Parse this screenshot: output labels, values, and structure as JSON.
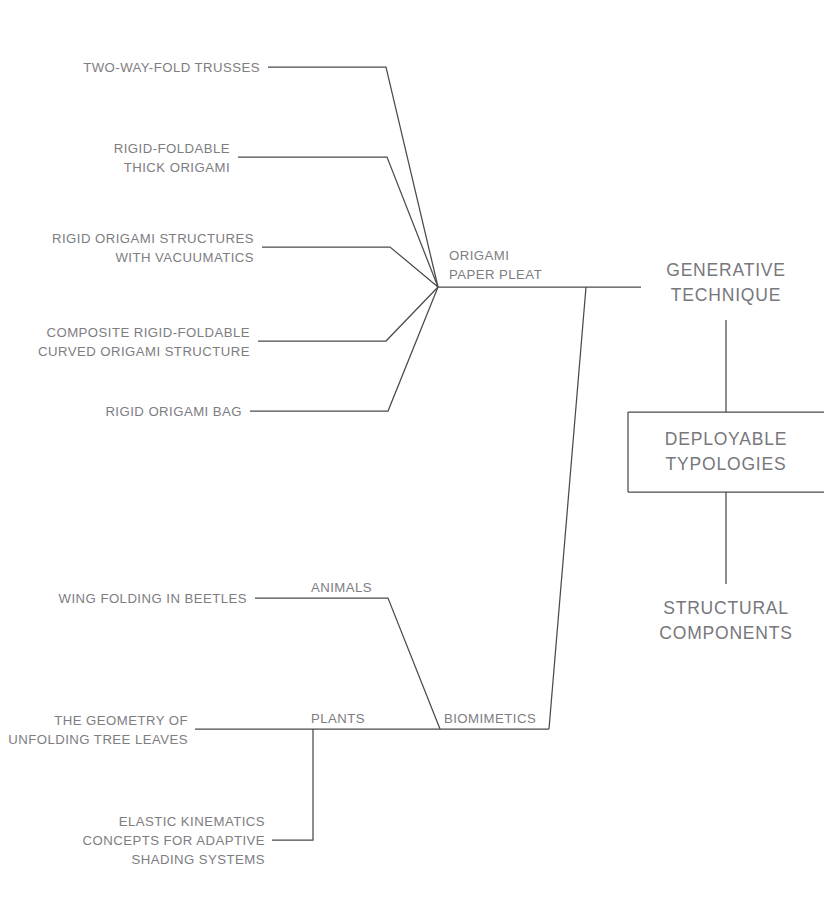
{
  "diagram": {
    "stroke_color": "#4a4a4f",
    "text_color": "#7d7d82",
    "background_color": "#ffffff",
    "leaves_origami": [
      {
        "id": "two-way-fold-trusses",
        "lines": [
          "TWO-WAY-FOLD TRUSSES"
        ]
      },
      {
        "id": "rigid-foldable-thick-origami",
        "lines": [
          "RIGID-FOLDABLE",
          "THICK ORIGAMI"
        ]
      },
      {
        "id": "rigid-origami-structures-with-vacuumatics",
        "lines": [
          "RIGID ORIGAMI STRUCTURES",
          "WITH VACUUMATICS"
        ]
      },
      {
        "id": "composite-rigid-foldable-curved-origami-structure",
        "lines": [
          "COMPOSITE RIGID-FOLDABLE",
          "CURVED ORIGAMI STRUCTURE"
        ]
      },
      {
        "id": "rigid-origami-bag",
        "lines": [
          "RIGID ORIGAMI BAG"
        ]
      }
    ],
    "leaves_biomimetics": [
      {
        "id": "wing-folding-in-beetles",
        "lines": [
          "WING FOLDING IN BEETLES"
        ]
      },
      {
        "id": "the-geometry-of-unfolding-tree-leaves",
        "lines": [
          "THE GEOMETRY OF",
          "UNFOLDING TREE LEAVES"
        ]
      },
      {
        "id": "elastic-kinematics-concepts-for-adaptive-shading-systems",
        "lines": [
          "ELASTIC KINEMATICS",
          "CONCEPTS FOR ADAPTIVE",
          "SHADING SYSTEMS"
        ]
      }
    ],
    "hubs": {
      "origami_paper_pleat": {
        "lines": [
          "ORIGAMI",
          "PAPER PLEAT"
        ]
      },
      "animals": {
        "label": "ANIMALS"
      },
      "plants": {
        "label": "PLANTS"
      },
      "biomimetics": {
        "label": "BIOMIMETICS"
      }
    },
    "categories": {
      "generative_technique": {
        "lines": [
          "GENERATIVE",
          "TECHNIQUE"
        ]
      },
      "deployable_typologies": {
        "lines": [
          "DEPLOYABLE",
          "TYPOLOGIES"
        ]
      },
      "structural_components": {
        "lines": [
          "STRUCTURAL",
          "COMPONENTS"
        ]
      }
    }
  }
}
